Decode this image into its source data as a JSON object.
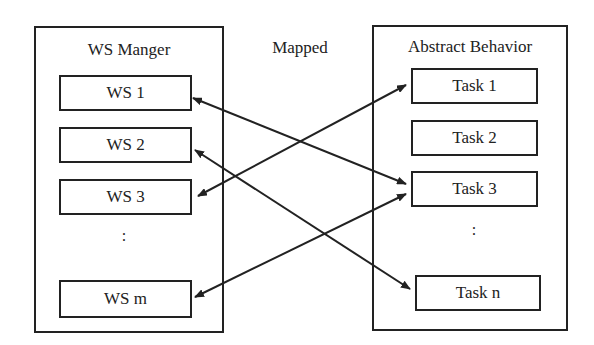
{
  "left_group": {
    "title": "WS Manger",
    "items": [
      "WS 1",
      "WS 2",
      "WS 3",
      "WS m"
    ],
    "ellipsis": ":"
  },
  "center_label": "Mapped",
  "right_group": {
    "title": "Abstract  Behavior",
    "items": [
      "Task 1",
      "Task 2",
      "Task 3",
      "Task n"
    ],
    "ellipsis": ":"
  },
  "mappings": [
    {
      "from": "WS 1",
      "to": "Task 3",
      "bidirectional": true
    },
    {
      "from": "WS 2",
      "to": "Task n",
      "bidirectional": true
    },
    {
      "from": "WS 3",
      "to": "Task 1",
      "bidirectional": true
    },
    {
      "from": "WS m",
      "to": "Task 3",
      "bidirectional": true
    }
  ],
  "colors": {
    "stroke": "#222222",
    "background": "#ffffff"
  }
}
